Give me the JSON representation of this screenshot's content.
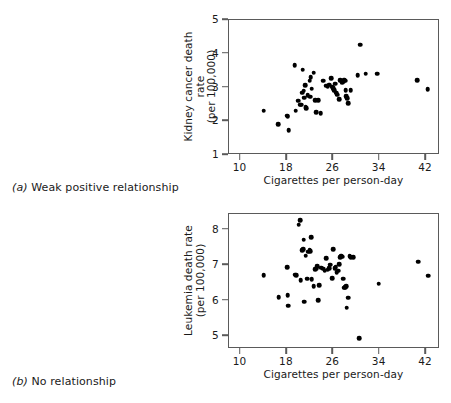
{
  "figure": {
    "panels": [
      {
        "id": "a",
        "caption_tag": "(a)",
        "caption_text": " Weak positive relationship"
      },
      {
        "id": "b",
        "caption_tag": "(b)",
        "caption_text": " No relationship"
      }
    ]
  },
  "chart_data": [
    {
      "type": "scatter",
      "panel": "a",
      "title": "",
      "xlabel": "Cigarettes per person-day",
      "ylabel": "Kidney cancer death rate",
      "ylabel_line2": "(per 100,000)",
      "xlim": [
        8,
        44.4
      ],
      "ylim": [
        0.82,
        5.1
      ],
      "xticks": [
        10,
        18,
        26,
        34,
        42
      ],
      "xtick_labels": [
        "10",
        "18",
        "26",
        "34",
        "42"
      ],
      "yticks": [
        1,
        2,
        3,
        4,
        5
      ],
      "ytick_labels": [
        "1",
        "2",
        "3",
        "4",
        "5"
      ],
      "grid": false,
      "legend": "none",
      "marker_color": "#000000",
      "points": [
        [
          14.0,
          2.22
        ],
        [
          16.5,
          1.79
        ],
        [
          18.0,
          2.07
        ],
        [
          18.1,
          2.03
        ],
        [
          18.3,
          1.61
        ],
        [
          19.3,
          3.67
        ],
        [
          19.5,
          2.23
        ],
        [
          19.9,
          2.54
        ],
        [
          20.3,
          2.42
        ],
        [
          20.5,
          2.41
        ],
        [
          20.6,
          2.8
        ],
        [
          20.7,
          3.52
        ],
        [
          20.9,
          2.86
        ],
        [
          21.0,
          2.64
        ],
        [
          21.1,
          3.04
        ],
        [
          21.2,
          2.33
        ],
        [
          21.3,
          2.3
        ],
        [
          21.6,
          2.72
        ],
        [
          21.9,
          3.18
        ],
        [
          22.0,
          2.67
        ],
        [
          22.1,
          3.29
        ],
        [
          22.3,
          2.92
        ],
        [
          22.6,
          3.43
        ],
        [
          22.9,
          2.56
        ],
        [
          23.0,
          2.17
        ],
        [
          23.4,
          2.55
        ],
        [
          23.8,
          2.15
        ],
        [
          24.2,
          3.17
        ],
        [
          24.8,
          3.02
        ],
        [
          25.0,
          2.98
        ],
        [
          25.3,
          3.05
        ],
        [
          25.6,
          3.26
        ],
        [
          25.8,
          2.99
        ],
        [
          26.0,
          2.94
        ],
        [
          26.1,
          2.88
        ],
        [
          26.3,
          3.08
        ],
        [
          26.5,
          2.8
        ],
        [
          26.7,
          2.73
        ],
        [
          27.0,
          2.58
        ],
        [
          27.2,
          3.19
        ],
        [
          27.5,
          3.12
        ],
        [
          27.8,
          3.15
        ],
        [
          27.9,
          3.21
        ],
        [
          28.0,
          3.18
        ],
        [
          28.1,
          2.87
        ],
        [
          28.2,
          2.68
        ],
        [
          28.4,
          2.62
        ],
        [
          28.6,
          2.46
        ],
        [
          29.0,
          2.88
        ],
        [
          30.2,
          3.35
        ],
        [
          30.6,
          4.32
        ],
        [
          31.6,
          3.4
        ],
        [
          33.6,
          3.4
        ],
        [
          40.5,
          3.2
        ],
        [
          42.3,
          2.9
        ]
      ]
    },
    {
      "type": "scatter",
      "panel": "b",
      "title": "",
      "xlabel": "Cigarettes per person-day",
      "ylabel": "Leukemia death rate",
      "ylabel_line2": "(per 100,000)",
      "xlim": [
        8,
        44.4
      ],
      "ylim": [
        4.63,
        8.45
      ],
      "xticks": [
        10,
        18,
        26,
        34,
        42
      ],
      "xtick_labels": [
        "10",
        "18",
        "26",
        "34",
        "42"
      ],
      "yticks": [
        5,
        6,
        7,
        8
      ],
      "ytick_labels": [
        "5",
        "6",
        "7",
        "8"
      ],
      "grid": false,
      "legend": "none",
      "marker_color": "#000000",
      "points": [
        [
          14.0,
          6.72
        ],
        [
          16.6,
          6.1
        ],
        [
          18.0,
          6.95
        ],
        [
          18.1,
          6.15
        ],
        [
          18.2,
          5.85
        ],
        [
          19.4,
          6.73
        ],
        [
          19.6,
          6.72
        ],
        [
          20.0,
          8.15
        ],
        [
          20.3,
          8.28
        ],
        [
          20.4,
          6.58
        ],
        [
          20.6,
          7.42
        ],
        [
          20.8,
          7.46
        ],
        [
          20.9,
          7.72
        ],
        [
          21.0,
          5.97
        ],
        [
          21.2,
          7.27
        ],
        [
          21.5,
          6.62
        ],
        [
          21.7,
          7.38
        ],
        [
          21.9,
          7.43
        ],
        [
          22.0,
          7.4
        ],
        [
          22.2,
          7.8
        ],
        [
          22.3,
          6.6
        ],
        [
          22.6,
          6.41
        ],
        [
          22.9,
          6.89
        ],
        [
          23.0,
          6.9
        ],
        [
          23.2,
          6.98
        ],
        [
          23.4,
          6.01
        ],
        [
          23.6,
          6.44
        ],
        [
          23.9,
          6.93
        ],
        [
          24.2,
          6.9
        ],
        [
          24.5,
          6.85
        ],
        [
          24.8,
          7.2
        ],
        [
          25.0,
          6.87
        ],
        [
          25.3,
          6.92
        ],
        [
          25.5,
          7.02
        ],
        [
          25.8,
          6.63
        ],
        [
          26.0,
          7.46
        ],
        [
          26.2,
          6.91
        ],
        [
          26.4,
          6.95
        ],
        [
          26.6,
          6.8
        ],
        [
          26.8,
          6.85
        ],
        [
          27.0,
          7.03
        ],
        [
          27.2,
          7.23
        ],
        [
          27.4,
          7.27
        ],
        [
          27.5,
          7.24
        ],
        [
          27.7,
          6.62
        ],
        [
          27.9,
          6.36
        ],
        [
          28.0,
          6.38
        ],
        [
          28.2,
          6.4
        ],
        [
          28.3,
          5.8
        ],
        [
          28.6,
          6.08
        ],
        [
          28.8,
          7.25
        ],
        [
          29.0,
          7.22
        ],
        [
          29.4,
          7.22
        ],
        [
          30.5,
          4.94
        ],
        [
          33.8,
          6.48
        ],
        [
          40.6,
          7.1
        ],
        [
          42.4,
          6.7
        ]
      ]
    }
  ]
}
